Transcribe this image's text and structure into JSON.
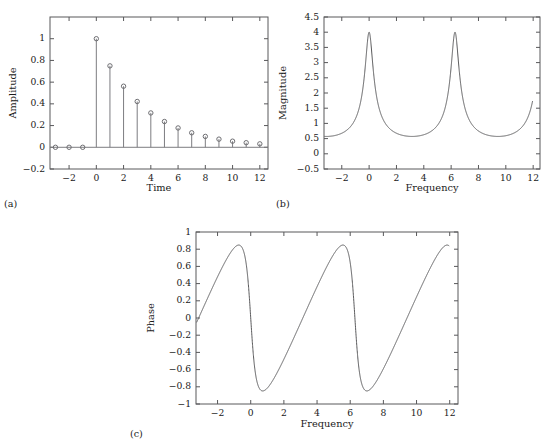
{
  "figure": {
    "panels": [
      {
        "tag": "(a)",
        "xlabel": "Time",
        "ylabel": "Amplitude"
      },
      {
        "tag": "(b)",
        "xlabel": "Frequency",
        "ylabel": "Magnitude"
      },
      {
        "tag": "(c)",
        "xlabel": "Frequency",
        "ylabel": "Phase"
      }
    ]
  },
  "chart_data": [
    {
      "type": "scatter",
      "panel": "(a)",
      "title": "",
      "xlabel": "Time",
      "ylabel": "Amplitude",
      "xlim": [
        -3.4,
        12.6
      ],
      "ylim": [
        -0.2,
        1.2
      ],
      "xticks": [
        -2,
        0,
        2,
        4,
        6,
        8,
        10,
        12
      ],
      "xticklabels": [
        "−2",
        "0",
        "2",
        "4",
        "6",
        "8",
        "10",
        "12"
      ],
      "yticks": [
        -0.2,
        0,
        0.2,
        0.4,
        0.6,
        0.8,
        1
      ],
      "yticklabels": [
        "−0.2",
        "0",
        "0.2",
        "0.4",
        "0.6",
        "0.8",
        "1"
      ],
      "grid": false,
      "legend": null,
      "marker": "open-circle",
      "description": "Stem plot of decaying exponential x[n] = 0.75^n u[n]",
      "x": [
        -3,
        -2,
        -1,
        0,
        1,
        2,
        3,
        4,
        5,
        6,
        7,
        8,
        9,
        10,
        11,
        12
      ],
      "values": [
        0,
        0,
        0,
        1,
        0.75,
        0.5625,
        0.4219,
        0.3164,
        0.2373,
        0.178,
        0.1335,
        0.1001,
        0.0751,
        0.0563,
        0.0422,
        0.0317
      ]
    },
    {
      "type": "line",
      "panel": "(b)",
      "title": "",
      "xlabel": "Frequency",
      "ylabel": "Magnitude",
      "xlim": [
        -3.3,
        12.5
      ],
      "ylim": [
        -0.5,
        4.5
      ],
      "xticks": [
        -2,
        0,
        2,
        4,
        6,
        8,
        10,
        12
      ],
      "xticklabels": [
        "−2",
        "0",
        "2",
        "4",
        "6",
        "8",
        "10",
        "12"
      ],
      "yticks": [
        -0.5,
        0,
        0.5,
        1,
        1.5,
        2,
        2.5,
        3,
        3.5,
        4,
        4.5
      ],
      "yticklabels": [
        "−0.5",
        "0",
        "0.5",
        "1",
        "1.5",
        "2",
        "2.5",
        "3",
        "3.5",
        "4",
        "4.5"
      ],
      "grid": false,
      "legend": null,
      "description": "DTFT magnitude |1/(1-0.75 e^{-jw})|, peaks of 4 at w=0 and w=2pi, minima 0.571 at w=pi and 3pi",
      "formula": "magnitude",
      "a": 0.75,
      "peak_value": 4,
      "min_value": 0.5714,
      "peak_positions": [
        0,
        6.2832
      ],
      "min_positions": [
        -3.1416,
        3.1416,
        9.4248
      ],
      "x_start": -3.25,
      "x_end": 11.95
    },
    {
      "type": "line",
      "panel": "(c)",
      "title": "",
      "xlabel": "Frequency",
      "ylabel": "Phase",
      "xlim": [
        -3.3,
        12.5
      ],
      "ylim": [
        -1,
        1
      ],
      "xticks": [
        -2,
        0,
        2,
        4,
        6,
        8,
        10,
        12
      ],
      "xticklabels": [
        "−2",
        "0",
        "2",
        "4",
        "6",
        "8",
        "10",
        "12"
      ],
      "yticks": [
        -1,
        -0.8,
        -0.6,
        -0.4,
        -0.2,
        0,
        0.2,
        0.4,
        0.6,
        0.8,
        1
      ],
      "yticklabels": [
        "−1",
        "−0.8",
        "−0.6",
        "−0.4",
        "−0.2",
        "0",
        "0.2",
        "0.4",
        "0.6",
        "0.8",
        "1"
      ],
      "grid": false,
      "legend": null,
      "description": "DTFT phase -atan(0.75 sin w /(1-0.75 cos w)), extrema about +/-0.85",
      "formula": "phase",
      "a": 0.75,
      "max_value": 0.848,
      "min_value": -0.848,
      "zero_crossings": [
        0,
        6.2832
      ],
      "x_start": -3.25,
      "x_end": 11.95
    }
  ]
}
